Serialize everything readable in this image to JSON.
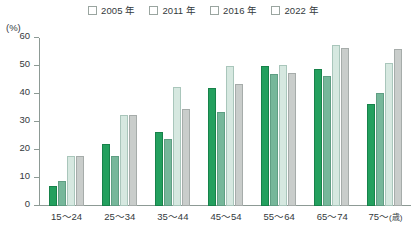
{
  "chart_data": {
    "type": "bar",
    "title": "",
    "xlabel": "(歳)",
    "ylabel": "(%)",
    "ylim": [
      0,
      60
    ],
    "yticks": [
      0,
      10,
      20,
      30,
      40,
      50,
      60
    ],
    "grid": false,
    "legend_position": "top",
    "categories": [
      "15〜24",
      "25〜34",
      "35〜44",
      "45〜54",
      "55〜64",
      "65〜74",
      "75〜"
    ],
    "series": [
      {
        "name": "2005 年",
        "color": "#23a05e",
        "values": [
          7,
          22,
          26.5,
          42,
          50,
          49,
          36.5
        ]
      },
      {
        "name": "2011 年",
        "color": "#76b79a",
        "values": [
          9,
          18,
          24,
          33.5,
          47,
          46.5,
          40.5
        ]
      },
      {
        "name": "2016 年",
        "color": "#d6e8e0",
        "values": [
          18,
          32.5,
          42.5,
          50,
          50.5,
          57.5,
          51
        ]
      },
      {
        "name": "2022 年",
        "color": "#c9cdcb",
        "values": [
          18,
          32.5,
          34.5,
          43.5,
          47.5,
          56.5,
          56
        ]
      }
    ]
  },
  "axis": {
    "unit_y": "(%)",
    "unit_x": "(歳)"
  }
}
